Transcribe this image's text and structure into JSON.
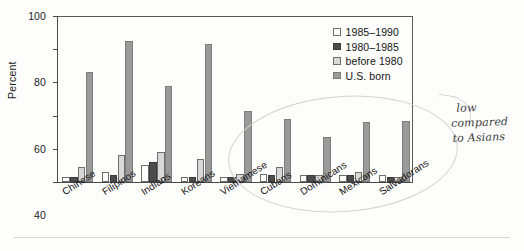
{
  "chart_data": {
    "type": "bar",
    "title": "",
    "xlabel": "",
    "ylabel": "Percent",
    "ylim": [
      0,
      100
    ],
    "yticks": [
      0,
      20,
      40,
      60,
      80,
      100
    ],
    "grid": false,
    "legend_position": "top-right",
    "categories": [
      "Chinese",
      "Filipinos",
      "Indians",
      "Koreans",
      "Vietnamese",
      "Cubans",
      "Dominicans",
      "Mexicans",
      "Salvadorans"
    ],
    "series": [
      {
        "name": "1985–1990",
        "color": "#ffffff",
        "values": [
          3,
          6,
          10,
          3,
          3,
          5,
          4,
          4,
          4
        ]
      },
      {
        "name": "1980–1985",
        "color": "#4c4c4c",
        "values": [
          3,
          4,
          12,
          3,
          3,
          4,
          4,
          4,
          3
        ]
      },
      {
        "name": "before 1980",
        "color": "#d8d8d8",
        "values": [
          9,
          16,
          18,
          14,
          5,
          9,
          4,
          6,
          3
        ]
      },
      {
        "name": "U.S. born",
        "color": "#9a9a9a",
        "values": [
          66,
          85,
          58,
          83,
          43,
          38,
          27,
          36,
          37
        ]
      }
    ]
  },
  "legend": {
    "entries": [
      {
        "label": "1985–1990",
        "swatch": "#ffffff"
      },
      {
        "label": "1980–1985",
        "swatch": "#4c4c4c"
      },
      {
        "label": "before 1980",
        "swatch": "#d8d8d8"
      },
      {
        "label": "U.S. born",
        "swatch": "#9a9a9a"
      }
    ]
  },
  "annotation": {
    "line1": "low",
    "line2": "compared",
    "line3": "to Asians"
  }
}
